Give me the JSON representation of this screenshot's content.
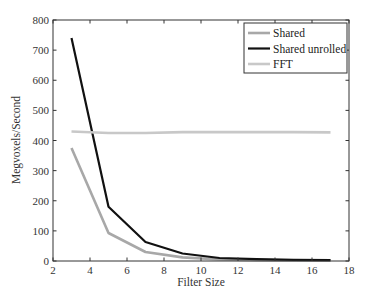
{
  "chart_data": {
    "type": "line",
    "title": "",
    "xlabel": "Filter Size",
    "ylabel": "Megvoxels/Second",
    "xlim": [
      2,
      18
    ],
    "ylim": [
      0,
      800
    ],
    "xticks": [
      2,
      4,
      6,
      8,
      10,
      12,
      14,
      16,
      18
    ],
    "yticks": [
      0,
      100,
      200,
      300,
      400,
      500,
      600,
      700,
      800
    ],
    "grid": false,
    "legend_position": "upper right",
    "x": [
      3,
      5,
      7,
      9,
      11,
      13,
      15,
      17
    ],
    "series": [
      {
        "name": "Shared",
        "color": "#a8a8a8",
        "values": [
          375,
          93,
          30,
          12,
          5,
          3,
          2,
          2
        ]
      },
      {
        "name": "Shared unrolled",
        "color": "#111111",
        "values": [
          740,
          180,
          63,
          25,
          10,
          6,
          4,
          3
        ]
      },
      {
        "name": "FFT",
        "color": "#c8c8c8",
        "values": [
          430,
          425,
          425,
          428,
          428,
          428,
          428,
          427
        ]
      }
    ]
  },
  "legend": {
    "items": [
      {
        "label": "Shared",
        "color": "#a8a8a8"
      },
      {
        "label": "Shared unrolled",
        "color": "#111111"
      },
      {
        "label": "FFT",
        "color": "#c8c8c8"
      }
    ]
  }
}
